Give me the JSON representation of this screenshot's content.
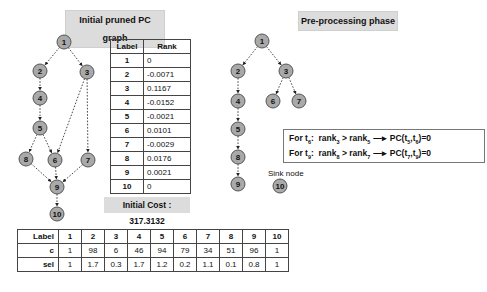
{
  "left_panel": {
    "title": "Initial pruned PC graph",
    "nodes": [
      {
        "id": "1",
        "x": 64,
        "y": 42
      },
      {
        "id": "2",
        "x": 40,
        "y": 71
      },
      {
        "id": "3",
        "x": 87,
        "y": 72
      },
      {
        "id": "4",
        "x": 40,
        "y": 98
      },
      {
        "id": "5",
        "x": 40,
        "y": 128
      },
      {
        "id": "8",
        "x": 26,
        "y": 159
      },
      {
        "id": "6",
        "x": 55,
        "y": 160
      },
      {
        "id": "7",
        "x": 88,
        "y": 160
      },
      {
        "id": "9",
        "x": 57,
        "y": 187
      },
      {
        "id": "10",
        "x": 57,
        "y": 214
      }
    ],
    "edges": [
      [
        "1",
        "2"
      ],
      [
        "1",
        "3"
      ],
      [
        "2",
        "4"
      ],
      [
        "4",
        "5"
      ],
      [
        "5",
        "8"
      ],
      [
        "5",
        "6"
      ],
      [
        "3",
        "6"
      ],
      [
        "3",
        "7"
      ],
      [
        "8",
        "9"
      ],
      [
        "6",
        "9"
      ],
      [
        "7",
        "9"
      ],
      [
        "9",
        "10"
      ]
    ],
    "rank_table": {
      "headers": [
        "Label",
        "Rank"
      ],
      "rows": [
        [
          "1",
          "0"
        ],
        [
          "2",
          "-0.0071"
        ],
        [
          "3",
          "0.1167"
        ],
        [
          "4",
          "-0.0152"
        ],
        [
          "5",
          "-0.0021"
        ],
        [
          "6",
          "0.0101"
        ],
        [
          "7",
          "-0.0029"
        ],
        [
          "8",
          "0.0176"
        ],
        [
          "9",
          "0.0021"
        ],
        [
          "10",
          "0"
        ]
      ]
    },
    "initial_cost": "Initial Cost : 317.3132"
  },
  "right_panel": {
    "title": "Pre-processing phase",
    "nodes": [
      {
        "id": "1",
        "x": 262,
        "y": 41
      },
      {
        "id": "2",
        "x": 238,
        "y": 71
      },
      {
        "id": "3",
        "x": 286,
        "y": 71
      },
      {
        "id": "4",
        "x": 238,
        "y": 101
      },
      {
        "id": "6",
        "x": 273,
        "y": 101
      },
      {
        "id": "7",
        "x": 299,
        "y": 101
      },
      {
        "id": "5",
        "x": 238,
        "y": 129
      },
      {
        "id": "8",
        "x": 238,
        "y": 157
      },
      {
        "id": "9",
        "x": 238,
        "y": 184
      },
      {
        "id": "10",
        "x": 280,
        "y": 186
      }
    ],
    "edges": [
      [
        "1",
        "2"
      ],
      [
        "1",
        "3"
      ],
      [
        "2",
        "4"
      ],
      [
        "3",
        "6"
      ],
      [
        "3",
        "7"
      ],
      [
        "4",
        "5"
      ],
      [
        "5",
        "8"
      ],
      [
        "8",
        "9"
      ]
    ],
    "sink_label": "Sink node",
    "rules": [
      {
        "prefix": "For t",
        "t": "6",
        "colon": ":",
        "rank_a": "3",
        "rank_b": "5",
        "result_pre": "PC(t",
        "p1": "5",
        "p2": "6",
        "result_post": ")=0"
      },
      {
        "prefix": "For t",
        "t": "9",
        "colon": ":",
        "rank_a": "8",
        "rank_b": "7",
        "result_pre": "PC(t",
        "p1": "7",
        "p2": "9",
        "result_post": ")=0"
      }
    ]
  },
  "selectivity_table": {
    "header_label": "Label",
    "labels": [
      "1",
      "2",
      "3",
      "4",
      "5",
      "6",
      "7",
      "8",
      "9",
      "10"
    ],
    "rows": [
      {
        "name": "c",
        "values": [
          "1",
          "98",
          "6",
          "46",
          "94",
          "79",
          "34",
          "51",
          "96",
          "1"
        ]
      },
      {
        "name": "sel",
        "values": [
          "1",
          "1.7",
          "0.3",
          "1.7",
          "1.2",
          "0.2",
          "1.1",
          "0.1",
          "0.8",
          "1"
        ]
      }
    ]
  }
}
